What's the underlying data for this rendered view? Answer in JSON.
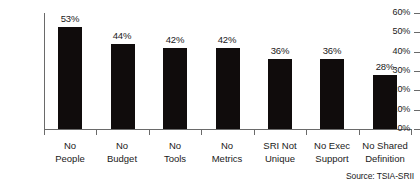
{
  "chart_data": {
    "type": "bar",
    "title": "",
    "xlabel": "",
    "ylabel": "",
    "categories": [
      "No People",
      "No Budget",
      "No Tools",
      "No Metrics",
      "SRI Not Unique",
      "No Exec Support",
      "No Shared Definition"
    ],
    "category_lines": [
      [
        "No",
        "People"
      ],
      [
        "No",
        "Budget"
      ],
      [
        "No",
        "Tools"
      ],
      [
        "No",
        "Metrics"
      ],
      [
        "SRI Not",
        "Unique"
      ],
      [
        "No Exec",
        "Support"
      ],
      [
        "No Shared",
        "Definition"
      ]
    ],
    "values": [
      53,
      44,
      42,
      42,
      36,
      36,
      28
    ],
    "value_labels": [
      "53%",
      "44%",
      "42%",
      "42%",
      "36%",
      "36%",
      "28%"
    ],
    "ylim": [
      0,
      60
    ],
    "ytick_values": [
      60,
      50,
      40,
      30,
      20,
      10,
      0
    ],
    "ytick_labels": [
      "60%",
      "50%",
      "40%",
      "30%",
      "20%",
      "10%",
      "0%"
    ],
    "grid": false,
    "legend": "none",
    "bar_color": "#100c0c",
    "axis_color": "#6a6a6a",
    "text_color": "#1a1a1a",
    "background": "#ffffff"
  },
  "annotations": {
    "source": "Source: TSIA-SRII"
  }
}
